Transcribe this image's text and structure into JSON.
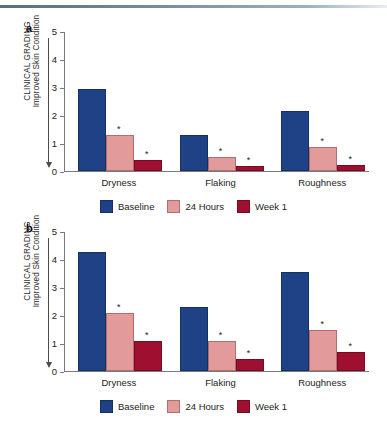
{
  "figure": {
    "axis_label_line1": "CLINICAL GRADING",
    "axis_label_line2": "Improved Skin Condition",
    "panel_a_letter": "a",
    "panel_b_letter": "b",
    "significance_marker": "*"
  },
  "colors": {
    "baseline": "#1f4186",
    "hours24": "#e29a9a",
    "week1": "#9e0f30",
    "axis": "#7a7a7a",
    "rule": "#7d8da3"
  },
  "legend": {
    "items": [
      {
        "label": "Baseline",
        "key": "baseline"
      },
      {
        "label": "24 Hours",
        "key": "hours24"
      },
      {
        "label": "Week 1",
        "key": "week1"
      }
    ]
  },
  "chart_data": [
    {
      "type": "bar",
      "panel": "a",
      "title": "",
      "xlabel": "",
      "ylabel": "CLINICAL GRADING Improved Skin Condition",
      "ylim": [
        0,
        5
      ],
      "yticks": [
        0,
        1,
        2,
        3,
        4,
        5
      ],
      "grid": false,
      "legend_position": "bottom",
      "categories": [
        "Dryness",
        "Flaking",
        "Roughness"
      ],
      "series": [
        {
          "name": "Baseline",
          "values": [
            2.85,
            1.2,
            2.07
          ],
          "significant": [
            false,
            false,
            false
          ]
        },
        {
          "name": "24 Hours",
          "values": [
            1.22,
            0.43,
            0.8
          ],
          "significant": [
            true,
            true,
            true
          ]
        },
        {
          "name": "Week 1",
          "values": [
            0.33,
            0.09,
            0.14
          ],
          "significant": [
            true,
            true,
            true
          ]
        }
      ]
    },
    {
      "type": "bar",
      "panel": "b",
      "title": "",
      "xlabel": "",
      "ylabel": "CLINICAL GRADING Improved Skin Condition",
      "ylim": [
        0,
        5
      ],
      "yticks": [
        0,
        1,
        2,
        3,
        4,
        5
      ],
      "grid": false,
      "legend_position": "bottom",
      "categories": [
        "Dryness",
        "Flaking",
        "Roughness"
      ],
      "series": [
        {
          "name": "Baseline",
          "values": [
            4.18,
            2.2,
            3.48
          ],
          "significant": [
            false,
            false,
            false
          ]
        },
        {
          "name": "24 Hours",
          "values": [
            2.0,
            1.0,
            1.38
          ],
          "significant": [
            true,
            true,
            true
          ]
        },
        {
          "name": "Week 1",
          "values": [
            1.0,
            0.35,
            0.6
          ],
          "significant": [
            true,
            true,
            true
          ]
        }
      ]
    }
  ]
}
